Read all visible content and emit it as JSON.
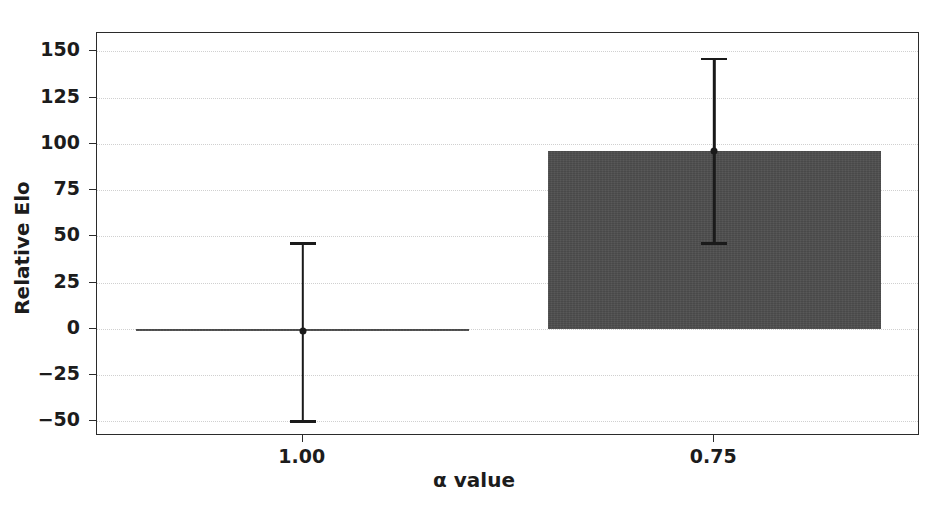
{
  "chart_data": {
    "type": "bar",
    "title": "",
    "subtitle": "",
    "xlabel": "α value",
    "ylabel": "Relative Elo",
    "categories": [
      "1.00",
      "0.75"
    ],
    "values": [
      -1,
      96
    ],
    "series": [
      {
        "name": "Relative Elo",
        "values": [
          -1,
          96
        ],
        "errors_low": [
          -50,
          46
        ],
        "errors_high": [
          46,
          146
        ]
      }
    ],
    "error_bars": [
      {
        "category": "1.00",
        "center": -1,
        "low": -50,
        "high": 46
      },
      {
        "category": "0.75",
        "center": 96,
        "low": 46,
        "high": 146
      }
    ],
    "ylim": [
      -58,
      160
    ],
    "xlim": [
      0,
      2
    ],
    "yticks": [
      -50,
      -25,
      0,
      25,
      50,
      75,
      100,
      125,
      150
    ],
    "ytick_labels": [
      "−50",
      "−25",
      "0",
      "25",
      "50",
      "75",
      "100",
      "125",
      "150"
    ],
    "xticks": [
      0.5,
      1.5
    ],
    "xtick_labels": [
      "1.00",
      "0.75"
    ],
    "grid": true,
    "grid_axis": "y",
    "legend": null,
    "legend_position": "none",
    "bar_color": "#4d4d4d",
    "error_color": "#1a1a1a",
    "grid_color": "#d0d0d0",
    "axis_color": "#2b2b2b",
    "background_color": "#ffffff",
    "bar_width_fraction": 0.81
  }
}
